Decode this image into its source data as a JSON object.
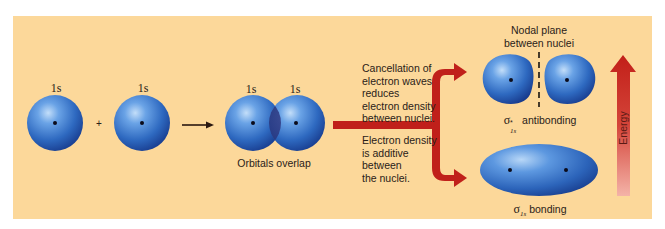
{
  "diagram": {
    "colors": {
      "background": "#fcd89a",
      "orbital": "#2f6fc4",
      "orbital_highlight": "#a9cdf5",
      "orbital_edge": "#1a3f8c",
      "arrow_red": "#c0201a",
      "energy_arrow_top": "#c4201a",
      "energy_arrow_bottom": "#f2b0a6",
      "text": "#2a2118"
    },
    "atomic_orbitals": [
      {
        "label": "1s"
      },
      {
        "label": "1s"
      }
    ],
    "plus_sign": "+",
    "overlap": {
      "labels": [
        "1s",
        "1s"
      ],
      "caption": "Orbitals overlap"
    },
    "branch_texts": {
      "antibonding_explanation": "Cancellation of\nelectron waves\nreduces\nelectron density\nbetween nuclei.",
      "bonding_explanation": "Electron density\nis additive\nbetween\nthe nuclei."
    },
    "antibonding": {
      "nodal_plane_label": "Nodal plane\nbetween nuclei",
      "symbol": "σ",
      "superscript": "*",
      "subscript": "1s",
      "name": "antibonding"
    },
    "bonding": {
      "symbol": "σ",
      "subscript": "1s",
      "name": "bonding"
    },
    "energy_axis": {
      "label": "Energy",
      "direction": "up"
    }
  }
}
